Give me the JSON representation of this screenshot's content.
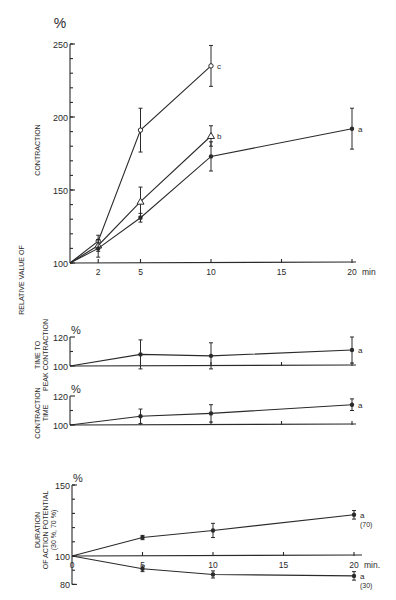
{
  "figure": {
    "side_label": "RELATIVE VALUE OF",
    "x_unit_label_top": "min",
    "x_unit_label_bottom": "min."
  },
  "chart_data": [
    {
      "id": "contraction",
      "type": "line",
      "title": "",
      "ylabel": "CONTRACTION",
      "unit_label": "%",
      "xlabel": "min",
      "x_ticks": [
        2,
        5,
        10,
        15,
        20
      ],
      "y_ticks": [
        100,
        150,
        200,
        250
      ],
      "y_minor_step": 10,
      "ylim": [
        100,
        250
      ],
      "xlim": [
        0,
        20
      ],
      "series": [
        {
          "name": "c",
          "marker": "open-circle",
          "x": [
            0,
            2,
            5,
            10
          ],
          "y": [
            100,
            115,
            191,
            235
          ],
          "err": [
            0,
            4,
            15,
            14
          ]
        },
        {
          "name": "b",
          "marker": "open-triangle",
          "x": [
            0,
            2,
            5,
            10
          ],
          "y": [
            100,
            112,
            142,
            187
          ],
          "err": [
            0,
            4,
            10,
            7
          ]
        },
        {
          "name": "a",
          "marker": "filled-circle",
          "x": [
            0,
            2,
            5,
            10,
            20
          ],
          "y": [
            100,
            110,
            131,
            173,
            192
          ],
          "err": [
            0,
            6,
            3,
            10,
            14
          ]
        }
      ]
    },
    {
      "id": "time_to_peak",
      "type": "line",
      "ylabel": "TIME TO PEAK CONTRACTION",
      "unit_label": "%",
      "y_ticks": [
        100,
        120
      ],
      "ylim": [
        100,
        120
      ],
      "xlim": [
        0,
        20
      ],
      "x_ticks_minor": [
        5,
        10,
        15,
        20
      ],
      "series": [
        {
          "name": "a",
          "marker": "filled-circle",
          "x": [
            0,
            5,
            10,
            20
          ],
          "y": [
            100,
            108,
            107,
            111
          ],
          "err": [
            0,
            10,
            9,
            9
          ]
        }
      ]
    },
    {
      "id": "contraction_time",
      "type": "line",
      "ylabel": "CONTRACTION TIME",
      "unit_label": "%",
      "y_ticks": [
        100,
        120
      ],
      "ylim": [
        100,
        120
      ],
      "xlim": [
        0,
        20
      ],
      "x_ticks_minor": [
        5,
        10,
        15,
        20
      ],
      "series": [
        {
          "name": "a",
          "marker": "filled-circle",
          "x": [
            0,
            5,
            10,
            20
          ],
          "y": [
            100,
            106,
            108,
            114
          ],
          "err": [
            0,
            5,
            6,
            4
          ]
        }
      ]
    },
    {
      "id": "action_potential",
      "type": "line",
      "ylabel": "DURATION OF ACTION POTENTIAL (30 %, 70 %)",
      "unit_label": "%",
      "xlabel": "min.",
      "x_ticks": [
        0,
        5,
        10,
        15,
        20
      ],
      "y_ticks": [
        80,
        100,
        150
      ],
      "y_minor_step": 10,
      "ylim": [
        80,
        150
      ],
      "xlim": [
        0,
        20
      ],
      "series": [
        {
          "name": "a",
          "sublabel": "(70)",
          "marker": "filled-circle",
          "x": [
            0,
            5,
            10,
            20
          ],
          "y": [
            100,
            113,
            118,
            129
          ],
          "err": [
            0,
            1.5,
            5,
            3
          ]
        },
        {
          "name": "a",
          "sublabel": "(30)",
          "marker": "filled-circle",
          "x": [
            0,
            5,
            10,
            20
          ],
          "y": [
            100,
            91,
            87,
            86
          ],
          "err": [
            0,
            2,
            2.5,
            3
          ]
        }
      ]
    }
  ]
}
